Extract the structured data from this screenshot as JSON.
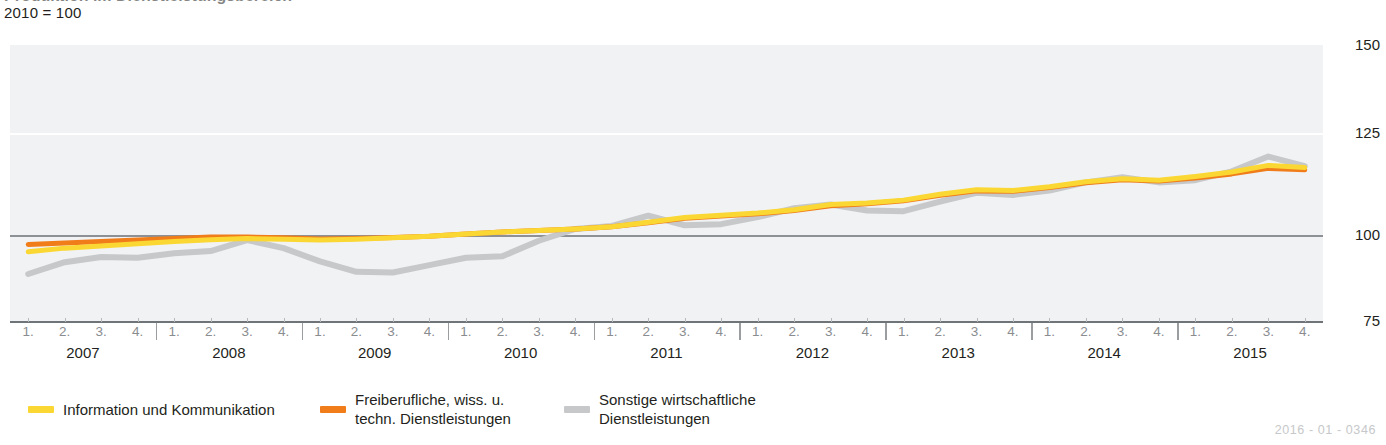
{
  "header": {
    "clipped_title": "Produktion im Dienstleistungsbereich",
    "subtitle": "2010 = 100"
  },
  "footer": {
    "doc_ref": "2016 - 01 - 0346"
  },
  "legend": {
    "items": [
      {
        "label": "Information und Kommunikation",
        "color": "#fbd733",
        "key": "information"
      },
      {
        "label": "Freiberufliche, wiss. u.\ntechn. Dienstleistungen",
        "color": "#f07d1a",
        "key": "freiberufliche"
      },
      {
        "label": "Sonstige wirtschaftliche\nDienstleistungen",
        "color": "#c6c8ca",
        "key": "sonstige"
      }
    ]
  },
  "chart_data": {
    "type": "line",
    "title": "Produktion im Dienstleistungsbereich",
    "subtitle": "2010 = 100",
    "xlabel": "",
    "ylabel": "",
    "ylim": [
      75,
      150
    ],
    "yticks": [
      150,
      125,
      100,
      75
    ],
    "grid": true,
    "legend_position": "bottom",
    "reference_line": 100,
    "years": [
      "2007",
      "2008",
      "2009",
      "2010",
      "2011",
      "2012",
      "2013",
      "2014",
      "2015"
    ],
    "quarter_labels": [
      "1.",
      "2.",
      "3.",
      "4."
    ],
    "x": [
      "2007-1.",
      "2007-2.",
      "2007-3.",
      "2007-4.",
      "2008-1.",
      "2008-2.",
      "2008-3.",
      "2008-4.",
      "2009-1.",
      "2009-2.",
      "2009-3.",
      "2009-4.",
      "2010-1.",
      "2010-2.",
      "2010-3.",
      "2010-4.",
      "2011-1.",
      "2011-2.",
      "2011-3.",
      "2011-4.",
      "2012-1.",
      "2012-2.",
      "2012-3.",
      "2012-4.",
      "2013-1.",
      "2013-2.",
      "2013-3.",
      "2013-4.",
      "2014-1.",
      "2014-2.",
      "2014-3.",
      "2014-4.",
      "2015-1.",
      "2015-2.",
      "2015-3.",
      "2015-4."
    ],
    "series": [
      {
        "name": "Information und Kommunikation",
        "color": "#fbd733",
        "values": [
          94.0,
          95.0,
          95.6,
          96.2,
          96.8,
          97.3,
          97.6,
          97.4,
          97.2,
          97.4,
          97.8,
          98.2,
          98.8,
          99.4,
          99.8,
          100.2,
          100.8,
          102.0,
          103.3,
          103.9,
          104.5,
          105.4,
          106.8,
          107.2,
          108.0,
          109.6,
          110.8,
          110.6,
          111.6,
          113.0,
          113.8,
          113.4,
          114.4,
          115.6,
          117.4,
          116.8
        ]
      },
      {
        "name": "Freiberufliche, wiss. u. techn. Dienstleistungen",
        "color": "#f07d1a",
        "values": [
          96.0,
          96.4,
          96.8,
          97.2,
          97.6,
          98.0,
          98.0,
          97.8,
          97.5,
          97.6,
          97.9,
          98.2,
          98.8,
          99.4,
          99.8,
          100.2,
          100.8,
          101.9,
          103.1,
          103.7,
          104.3,
          105.2,
          106.5,
          107.0,
          107.8,
          109.3,
          110.5,
          110.4,
          111.4,
          112.7,
          113.5,
          113.2,
          114.0,
          115.1,
          116.6,
          116.2
        ]
      },
      {
        "name": "Sonstige wirtschaftliche Dienstleistungen",
        "color": "#c6c8ca",
        "values": [
          88.0,
          91.2,
          92.6,
          92.4,
          93.6,
          94.2,
          97.2,
          95.0,
          91.4,
          88.6,
          88.4,
          90.4,
          92.4,
          92.8,
          97.0,
          100.2,
          101.0,
          103.8,
          101.2,
          101.5,
          103.4,
          105.8,
          106.8,
          105.2,
          105.0,
          107.6,
          110.0,
          109.4,
          110.6,
          112.8,
          114.2,
          112.8,
          113.4,
          115.8,
          119.8,
          117.2
        ]
      }
    ]
  }
}
